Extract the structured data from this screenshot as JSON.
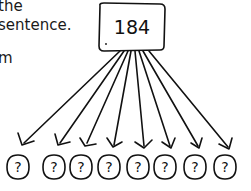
{
  "text": {
    "lines": [
      "the",
      "sentence.",
      "m"
    ]
  },
  "diagram": {
    "root_label": "184",
    "leaf_label": "?",
    "leaf_count": 8,
    "stroke_color": "#111111",
    "background_color": "#ffffff"
  }
}
